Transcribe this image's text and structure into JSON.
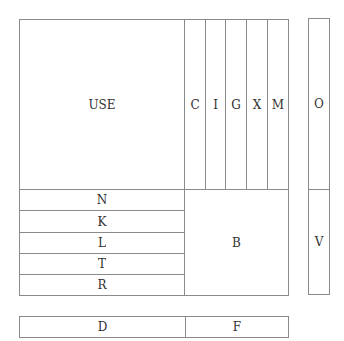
{
  "diagram": {
    "main": {
      "large": {
        "label": "USE"
      },
      "columns": [
        {
          "label": "C"
        },
        {
          "label": "I"
        },
        {
          "label": "G"
        },
        {
          "label": "X"
        },
        {
          "label": "M"
        }
      ],
      "rows": [
        {
          "label": "N"
        },
        {
          "label": "K"
        },
        {
          "label": "L"
        },
        {
          "label": "T"
        },
        {
          "label": "R"
        }
      ],
      "square": {
        "label": "B"
      }
    },
    "side": {
      "top": {
        "label": "O"
      },
      "bottom": {
        "label": "V"
      }
    },
    "bottom_bar": {
      "left": {
        "label": "D"
      },
      "right": {
        "label": "F"
      }
    }
  }
}
